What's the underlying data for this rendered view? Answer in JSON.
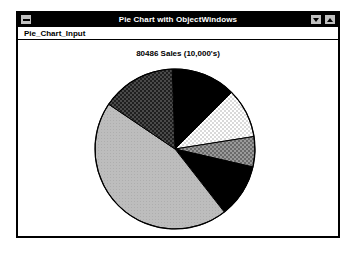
{
  "window": {
    "title": "Pie Chart with ObjectWindows",
    "sysmenu_icon": "system-menu-icon",
    "minimize_label": "",
    "maximize_label": "",
    "menu": [
      {
        "label": "Pie_Chart_Input"
      }
    ]
  },
  "chart_data": {
    "type": "pie",
    "title": "80486 Sales (10,000's)",
    "xlabel": "",
    "ylabel": "",
    "legend": "none",
    "grid": false,
    "start_angle_deg": -92,
    "direction": "clockwise",
    "center": {
      "cx": 83,
      "cy": 83,
      "r": 80
    },
    "categories": [
      "Slice 1",
      "Slice 2",
      "Slice 3",
      "Slice 4",
      "Slice 5",
      "Slice 6"
    ],
    "values": [
      13,
      10,
      6,
      11,
      45,
      15
    ],
    "slices": [
      {
        "name": "Slice 1",
        "value": 13,
        "start_deg": -92,
        "end_deg": -45,
        "fill": "solid-black",
        "color": "#000000"
      },
      {
        "name": "Slice 2",
        "value": 10,
        "start_deg": -45,
        "end_deg": -9,
        "fill": "light-dots",
        "color": "#f2f2f2"
      },
      {
        "name": "Slice 3",
        "value": 6,
        "start_deg": -9,
        "end_deg": 13,
        "fill": "medium-checker",
        "color": "#8a8a8a"
      },
      {
        "name": "Slice 4",
        "value": 11,
        "start_deg": 13,
        "end_deg": 52,
        "fill": "solid-black",
        "color": "#000000"
      },
      {
        "name": "Slice 5",
        "value": 45,
        "start_deg": 52,
        "end_deg": 214,
        "fill": "light-gray",
        "color": "#b8b8b8"
      },
      {
        "name": "Slice 6",
        "value": 15,
        "start_deg": 214,
        "end_deg": 268,
        "fill": "dark-checker",
        "color": "#383838"
      }
    ],
    "outline_color": "#000000"
  }
}
